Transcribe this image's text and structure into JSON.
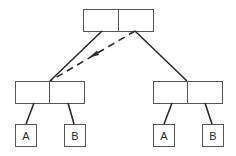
{
  "diagram": {
    "type": "tree",
    "colors": {
      "stroke": "#2a2a2a",
      "box_stroke": "#555555",
      "background": "#ffffff"
    },
    "nodes": {
      "root": {
        "label_left": "",
        "label_right": ""
      },
      "left_child": {
        "label_left": "",
        "label_right": ""
      },
      "right_child": {
        "label_left": "",
        "label_right": ""
      }
    },
    "leaves": {
      "left_a": {
        "label": "A"
      },
      "left_b": {
        "label": "B"
      },
      "right_a": {
        "label": "A"
      },
      "right_b": {
        "label": "B"
      }
    },
    "edges": [
      {
        "from": "root.left",
        "to": "left_child",
        "style": "solid"
      },
      {
        "from": "root.right",
        "to": "right_child",
        "style": "solid"
      },
      {
        "from": "root.right",
        "to": "left_child",
        "style": "dashed",
        "arrow": true
      },
      {
        "from": "left_child.left",
        "to": "left_a",
        "style": "solid"
      },
      {
        "from": "left_child.right",
        "to": "left_b",
        "style": "solid"
      },
      {
        "from": "right_child.left",
        "to": "right_a",
        "style": "solid"
      },
      {
        "from": "right_child.right",
        "to": "right_b",
        "style": "solid"
      }
    ]
  }
}
